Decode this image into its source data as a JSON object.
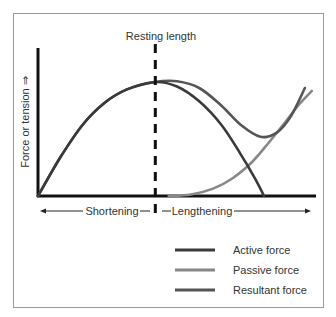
{
  "chart_data": {
    "type": "line",
    "title": "",
    "xlabel_left": "Shortening",
    "xlabel_right": "Lengthening",
    "ylabel": "Force or tension ⇒",
    "annotation": "Resting length",
    "resting_length_x": 4.22,
    "xlim": [
      0,
      10
    ],
    "ylim": [
      0,
      10
    ],
    "grid": false,
    "legend_position": "bottom-right",
    "series": [
      {
        "name": "Active force",
        "color": "#3a3a3a",
        "points": [
          [
            0,
            0
          ],
          [
            0.8,
            2.6
          ],
          [
            1.6,
            4.8
          ],
          [
            2.4,
            6.3
          ],
          [
            3.2,
            7.2
          ],
          [
            4.22,
            7.7
          ],
          [
            5.0,
            7.4
          ],
          [
            5.8,
            6.4
          ],
          [
            6.6,
            4.8
          ],
          [
            7.3,
            2.8
          ],
          [
            7.8,
            1.2
          ],
          [
            8.13,
            0
          ]
        ]
      },
      {
        "name": "Passive force",
        "color": "#888888",
        "points": [
          [
            4.7,
            0
          ],
          [
            5.5,
            0.1
          ],
          [
            6.3,
            0.5
          ],
          [
            7.0,
            1.2
          ],
          [
            7.7,
            2.3
          ],
          [
            8.3,
            3.6
          ],
          [
            8.9,
            5.0
          ],
          [
            9.4,
            6.2
          ],
          [
            9.85,
            7.1
          ]
        ]
      },
      {
        "name": "Resultant force",
        "color": "#555555",
        "points": [
          [
            0,
            0
          ],
          [
            0.8,
            2.6
          ],
          [
            1.6,
            4.8
          ],
          [
            2.4,
            6.3
          ],
          [
            3.2,
            7.2
          ],
          [
            4.22,
            7.7
          ],
          [
            5.0,
            7.75
          ],
          [
            5.8,
            7.3
          ],
          [
            6.6,
            6.1
          ],
          [
            7.3,
            4.8
          ],
          [
            8.0,
            4.0
          ],
          [
            8.6,
            4.3
          ],
          [
            9.1,
            5.4
          ],
          [
            9.6,
            7.3
          ]
        ]
      }
    ],
    "legend": [
      {
        "label": "Active force",
        "color": "#3a3a3a"
      },
      {
        "label": "Passive force",
        "color": "#888888"
      },
      {
        "label": "Resultant force",
        "color": "#555555"
      }
    ]
  }
}
